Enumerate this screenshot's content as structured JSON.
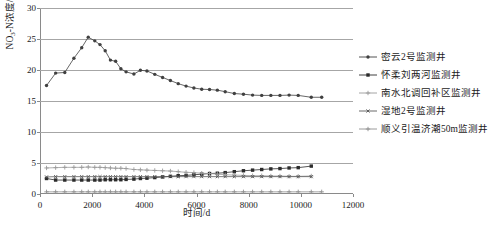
{
  "chart_data": {
    "type": "line",
    "title": "",
    "xlabel": "时间/d",
    "ylabel": "NO₃-N浓度/(mg/L)",
    "xlim": [
      0,
      12000
    ],
    "ylim": [
      0,
      30
    ],
    "xticks": [
      0,
      2000,
      4000,
      6000,
      8000,
      10000,
      12000
    ],
    "yticks": [
      0,
      5,
      10,
      15,
      20,
      25,
      30
    ],
    "grid": "horizontal",
    "legend_position": "right",
    "series": [
      {
        "name": "密云2号监测井",
        "color": "#404040",
        "marker": "circle",
        "x": [
          250,
          600,
          950,
          1300,
          1600,
          1850,
          2100,
          2300,
          2500,
          2700,
          2900,
          3100,
          3300,
          3600,
          3850,
          4100,
          4400,
          4700,
          5000,
          5300,
          5600,
          5900,
          6200,
          6500,
          6800,
          7100,
          7450,
          7800,
          8150,
          8500,
          8850,
          9200,
          9550,
          9900,
          10400,
          10800
        ],
        "y": [
          17.5,
          19.5,
          19.6,
          21.9,
          23.6,
          25.3,
          24.7,
          24.1,
          23.1,
          21.6,
          21.4,
          20.2,
          19.7,
          19.35,
          19.95,
          19.85,
          19.3,
          18.8,
          18.3,
          17.8,
          17.4,
          17.1,
          16.9,
          16.85,
          16.75,
          16.5,
          16.2,
          16.1,
          15.95,
          15.9,
          15.9,
          15.9,
          15.95,
          15.9,
          15.6,
          15.6
        ]
      },
      {
        "name": "怀柔刘两河监测井",
        "color": "#2b2b2b",
        "marker": "square",
        "x": [
          250,
          600,
          950,
          1300,
          1600,
          1850,
          2100,
          2300,
          2500,
          2700,
          2900,
          3100,
          3300,
          3600,
          3850,
          4100,
          4400,
          4700,
          5000,
          5300,
          5600,
          5900,
          6200,
          6500,
          6800,
          7100,
          7450,
          7800,
          8150,
          8500,
          8850,
          9200,
          9550,
          9900,
          10400
        ],
        "y": [
          2.5,
          2.25,
          2.25,
          2.25,
          2.25,
          2.25,
          2.25,
          2.25,
          2.3,
          2.3,
          2.3,
          2.3,
          2.35,
          2.4,
          2.5,
          2.55,
          2.65,
          2.75,
          2.85,
          2.95,
          3.0,
          3.1,
          3.2,
          3.3,
          3.35,
          3.45,
          3.6,
          3.75,
          3.85,
          3.95,
          4.05,
          4.1,
          4.2,
          4.25,
          4.5
        ]
      },
      {
        "name": "南水北调回补区监测井",
        "color": "#9a9a9a",
        "marker": "plus",
        "x": [
          250,
          600,
          950,
          1300,
          1600,
          1850,
          2100,
          2300,
          2500,
          2700,
          2900,
          3100,
          3300,
          3600,
          3850,
          4100,
          4400,
          4700,
          5000,
          5300,
          5600,
          5900,
          6200,
          6500,
          6800,
          7100,
          7450,
          7800,
          8150,
          8500,
          8850,
          9200,
          9550,
          9900,
          10400
        ],
        "y": [
          4.2,
          4.25,
          4.3,
          4.3,
          4.3,
          4.35,
          4.3,
          4.3,
          4.25,
          4.2,
          4.15,
          4.15,
          4.1,
          3.95,
          3.9,
          3.85,
          3.8,
          3.75,
          3.7,
          3.6,
          3.5,
          3.45,
          3.35,
          3.3,
          3.2,
          3.1,
          3.05,
          3.0,
          2.95,
          2.95,
          2.9,
          2.9,
          2.85,
          2.85,
          2.9
        ]
      },
      {
        "name": "湿地2号监测井",
        "color": "#5a5a5a",
        "marker": "cross",
        "x": [
          250,
          600,
          950,
          1300,
          1600,
          1850,
          2100,
          2300,
          2500,
          2700,
          2900,
          3100,
          3300,
          3600,
          3850,
          4100,
          4400,
          4700,
          5000,
          5300,
          5600,
          5900,
          6200,
          6500,
          6800,
          7100,
          7450,
          7800,
          8150,
          8500,
          8850,
          9200,
          9550,
          9900,
          10400
        ],
        "y": [
          2.75,
          2.8,
          2.8,
          2.8,
          2.8,
          2.8,
          2.8,
          2.8,
          2.8,
          2.8,
          2.8,
          2.8,
          2.8,
          2.8,
          2.8,
          2.8,
          2.8,
          2.8,
          2.8,
          2.8,
          2.8,
          2.8,
          2.8,
          2.8,
          2.8,
          2.8,
          2.8,
          2.8,
          2.8,
          2.8,
          2.8,
          2.8,
          2.8,
          2.8,
          2.8
        ]
      },
      {
        "name": "顺义引温济潮50m监测井",
        "color": "#8f8f8f",
        "marker": "plus",
        "x": [
          250,
          600,
          950,
          1300,
          1600,
          1850,
          2100,
          2300,
          2500,
          2700,
          2900,
          3100,
          3300,
          3600,
          3850,
          4100,
          4400,
          4700,
          5000,
          5300,
          5600,
          5900,
          6200,
          6500,
          6800,
          7100,
          7450,
          7800,
          8150,
          8500,
          8850,
          9200,
          9550,
          9900,
          10400,
          10800
        ],
        "y": [
          0.35,
          0.35,
          0.35,
          0.35,
          0.35,
          0.35,
          0.35,
          0.35,
          0.35,
          0.35,
          0.35,
          0.35,
          0.35,
          0.35,
          0.35,
          0.35,
          0.35,
          0.35,
          0.35,
          0.35,
          0.35,
          0.35,
          0.35,
          0.35,
          0.35,
          0.35,
          0.35,
          0.35,
          0.35,
          0.35,
          0.35,
          0.35,
          0.35,
          0.35,
          0.35,
          0.35
        ]
      }
    ]
  },
  "axes": {
    "ylabel_main": "NO",
    "ylabel_sub": "3",
    "ylabel_rest": "-N浓度/(mg/L)",
    "xlabel": "时间/d"
  },
  "legend": {
    "items": [
      {
        "label": "密云2号监测井"
      },
      {
        "label": "怀柔刘两河监测井"
      },
      {
        "label": "南水北调回补区监测井"
      },
      {
        "label": "湿地2号监测井"
      },
      {
        "label": "顺义引温济潮50m监测井"
      }
    ]
  }
}
